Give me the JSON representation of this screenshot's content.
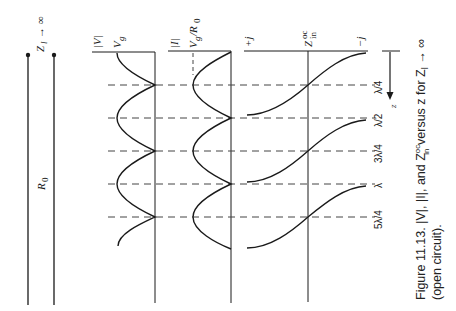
{
  "figure": {
    "caption_line1": "Figure 11.13.   |V|, |I|, and Z",
    "caption_sup": "oc",
    "caption_sub": "in",
    "caption_line1_tail": " versus z for Z",
    "caption_tail_sub": "l",
    "caption_tail_arrow": " → ∞",
    "caption_line2": "(open circuit).",
    "orientation": "rotated 90° clockwise"
  },
  "line": {
    "load_label": "Z",
    "load_sub": "l",
    "load_arrow": "→ ∞",
    "impedance_label": "R",
    "impedance_sub": "0"
  },
  "columns": {
    "voltage": {
      "axis_label": "|V|",
      "level_label": "V",
      "level_sub": "g"
    },
    "current": {
      "axis_label": "|I|",
      "level_label": "V",
      "level_sub": "g",
      "level_denom": "/R",
      "level_denom_sub": "0"
    },
    "impedance": {
      "plus_label": "+j",
      "center_label": "Z",
      "center_sup": "oc",
      "center_sub": "in",
      "minus_label": "−j"
    }
  },
  "axis_z": {
    "label": "z"
  },
  "positions": [
    {
      "label": "λ/4"
    },
    {
      "label": "λ/2"
    },
    {
      "label": "3λ/4"
    },
    {
      "label": "λ"
    },
    {
      "label": "5λ/4"
    }
  ],
  "colors": {
    "ink": "#1a1a1a",
    "dash": "#444444",
    "paper": "#ffffff"
  }
}
